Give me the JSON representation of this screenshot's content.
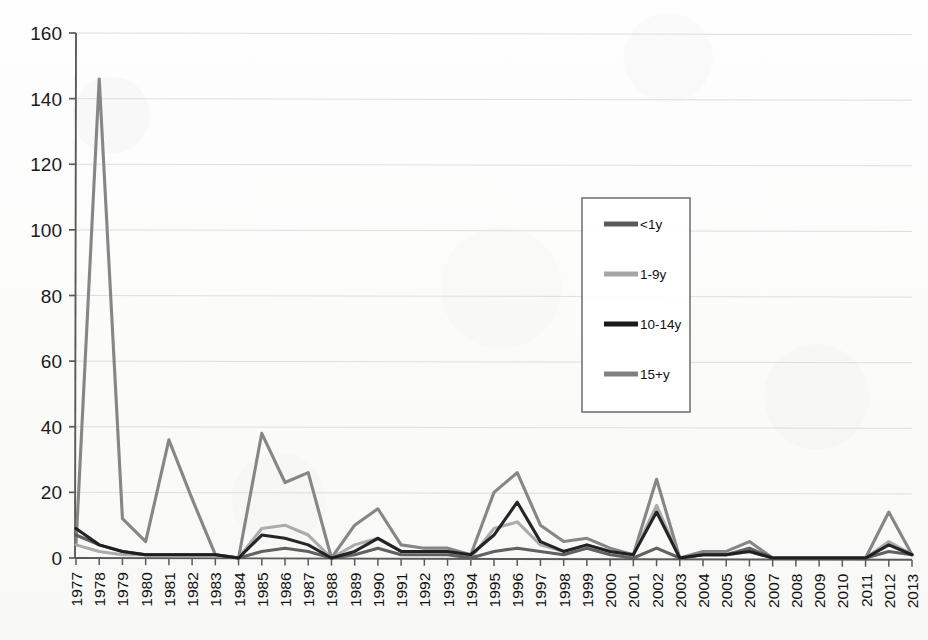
{
  "chart_data": {
    "type": "line",
    "title": "",
    "subtitle": "",
    "xlabel": "",
    "ylabel": "",
    "xlim_categories": [
      "1977",
      "2013"
    ],
    "ylim": [
      0,
      160
    ],
    "ytick_step": 20,
    "yticks": [
      0,
      20,
      40,
      60,
      80,
      100,
      120,
      140,
      160
    ],
    "grid": true,
    "grid_axis": "y",
    "legend_position": "center-right-inside-box",
    "legend_box": true,
    "categories": [
      "1977",
      "1978",
      "1979",
      "1980",
      "1981",
      "1982",
      "1983",
      "1984",
      "1985",
      "1986",
      "1987",
      "1988",
      "1989",
      "1990",
      "1991",
      "1992",
      "1993",
      "1994",
      "1995",
      "1996",
      "1997",
      "1998",
      "1999",
      "2000",
      "2001",
      "2002",
      "2003",
      "2004",
      "2005",
      "2006",
      "2007",
      "2008",
      "2009",
      "2010",
      "2011",
      "2012",
      "2013"
    ],
    "series": [
      {
        "name": "<1y",
        "color": "#595959",
        "values": [
          7,
          4,
          2,
          1,
          1,
          1,
          1,
          0,
          2,
          3,
          2,
          0,
          1,
          3,
          1,
          1,
          1,
          0,
          2,
          3,
          2,
          1,
          3,
          1,
          0,
          3,
          0,
          1,
          1,
          3,
          0,
          0,
          0,
          0,
          0,
          2,
          1
        ]
      },
      {
        "name": "1-9y",
        "color": "#A6A6A6",
        "values": [
          4,
          2,
          1,
          1,
          1,
          1,
          1,
          0,
          9,
          10,
          7,
          0,
          4,
          6,
          2,
          2,
          2,
          0,
          9,
          11,
          4,
          2,
          4,
          2,
          1,
          16,
          0,
          1,
          1,
          2,
          0,
          0,
          0,
          0,
          0,
          5,
          1
        ]
      },
      {
        "name": "10-14y",
        "color": "#1A1A1A",
        "values": [
          9,
          4,
          2,
          1,
          1,
          1,
          1,
          0,
          7,
          6,
          4,
          0,
          2,
          6,
          2,
          2,
          2,
          1,
          7,
          17,
          5,
          2,
          4,
          2,
          1,
          14,
          0,
          1,
          1,
          2,
          0,
          0,
          0,
          0,
          0,
          4,
          1
        ]
      },
      {
        "name": "15+y",
        "color": "#808080",
        "values": [
          4,
          146,
          12,
          5,
          36,
          18,
          1,
          0,
          38,
          23,
          26,
          0,
          10,
          15,
          4,
          3,
          3,
          1,
          20,
          26,
          10,
          5,
          6,
          3,
          1,
          24,
          0,
          2,
          2,
          5,
          0,
          0,
          0,
          0,
          0,
          14,
          1
        ]
      }
    ]
  },
  "legend": {
    "items": [
      {
        "label": "<1y",
        "color": "#595959"
      },
      {
        "label": "1-9y",
        "color": "#A6A6A6"
      },
      {
        "label": "10-14y",
        "color": "#1A1A1A"
      },
      {
        "label": "15+y",
        "color": "#808080"
      }
    ]
  },
  "axes": {
    "y_tick_labels": [
      "160",
      "140",
      "120",
      "100",
      "80",
      "60",
      "40",
      "20",
      "0"
    ],
    "x_tick_labels": [
      "1977",
      "1978",
      "1979",
      "1980",
      "1981",
      "1982",
      "1983",
      "1984",
      "1985",
      "1986",
      "1987",
      "1988",
      "1989",
      "1990",
      "1991",
      "1992",
      "1993",
      "1994",
      "1995",
      "1996",
      "1997",
      "1998",
      "1999",
      "2000",
      "2001",
      "2002",
      "2003",
      "2004",
      "2005",
      "2006",
      "2007",
      "2008",
      "2009",
      "2010",
      "2011",
      "2012",
      "2013"
    ]
  },
  "colors": {
    "axis": "#5a5a5a",
    "grid": "#dcdcdc",
    "background": "#fdfdfc",
    "legend_border": "#6b6b6b"
  }
}
